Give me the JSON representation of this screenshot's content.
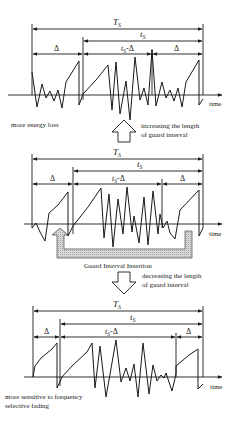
{
  "diagram": {
    "colors": {
      "line": "#1a1a1a",
      "insertion_fill": "#cfcfcf",
      "text": "#222222"
    },
    "panels": [
      {
        "id": "top",
        "label_Ts": "T",
        "label_Ts_sub": "S",
        "label_ts": "t",
        "label_ts_sub": "S",
        "label_ts_minus_delta": "t",
        "label_ts_minus_delta_sub": "S",
        "label_ts_minus_delta_suffix": "-Δ",
        "label_delta_left": "Δ",
        "label_delta_right": "Δ",
        "axis_label": "time",
        "annotation": "more energy loss"
      },
      {
        "id": "middle",
        "label_Ts": "T",
        "label_Ts_sub": "S",
        "label_ts": "t",
        "label_ts_sub": "S",
        "label_ts_minus_delta": "t",
        "label_ts_minus_delta_sub": "S",
        "label_ts_minus_delta_suffix": "-Δ",
        "label_delta_left": "Δ",
        "label_delta_right": "Δ",
        "axis_label": "time",
        "insertion_label": "Guard Interval Insertion"
      },
      {
        "id": "bottom",
        "label_Ts": "T",
        "label_Ts_sub": "S",
        "label_ts": "t",
        "label_ts_sub": "S",
        "label_ts_minus_delta": "t",
        "label_ts_minus_delta_sub": "S",
        "label_ts_minus_delta_suffix": "-Δ",
        "label_delta_left": "Δ",
        "label_delta_right": "Δ",
        "axis_label": "time",
        "annotation_line1": "more sensitive to frequency",
        "annotation_line2": "selective fading"
      }
    ],
    "transitions": {
      "up": {
        "line1": "increasing the length",
        "line2": "of guard interval",
        "icon": "up-hollow-arrow"
      },
      "down": {
        "line1": "decreasing the length",
        "line2": "of guard interval",
        "icon": "down-hollow-arrow"
      }
    }
  }
}
